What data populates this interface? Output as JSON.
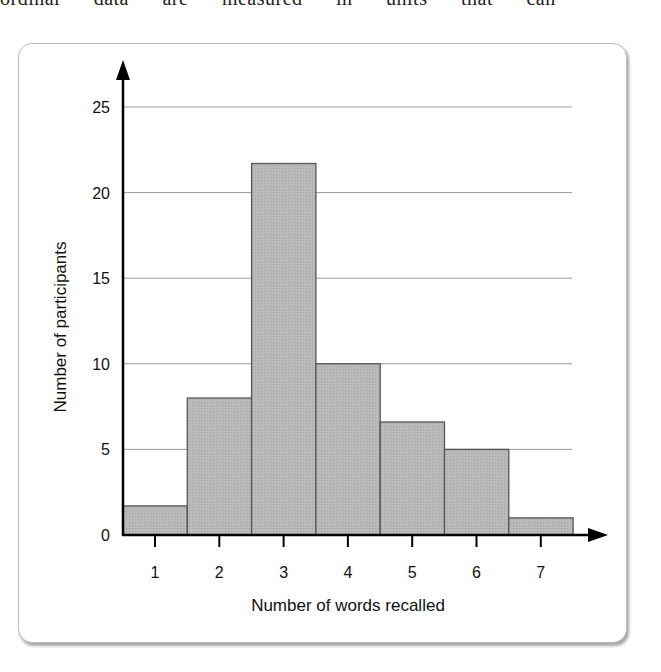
{
  "top_text": "ordinal data are measured in units that can",
  "chart_data": {
    "type": "bar",
    "title": "",
    "xlabel": "Number of words recalled",
    "ylabel": "Number of participants",
    "categories": [
      "1",
      "2",
      "3",
      "4",
      "5",
      "6",
      "7"
    ],
    "values": [
      1.7,
      8,
      21.7,
      10,
      6.6,
      5,
      1
    ],
    "ylim": [
      0,
      27
    ],
    "yticks": [
      0,
      5,
      10,
      15,
      20,
      25
    ],
    "grid": "horizontal",
    "legend": "none",
    "bar_color": "#b8b8b8",
    "bar_edge_color": "#555555"
  }
}
